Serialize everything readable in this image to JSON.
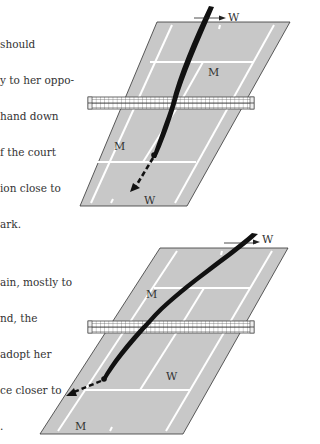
{
  "paragraphs": [
    {
      "id": "para1",
      "lines": [
        "should",
        "y to her oppo-",
        "hand down",
        "f the court",
        "ion close to",
        "ark."
      ]
    },
    {
      "id": "para2",
      "lines": [
        "ain, mostly to",
        "nd, the",
        "adopt her",
        "ce closer to",
        "."
      ]
    }
  ],
  "diagrams": [
    {
      "name": "top-court-diagram",
      "labels": {
        "server": "W",
        "far_player": "M",
        "near_player_left": "M",
        "near_player_bottom": "W"
      }
    },
    {
      "name": "bottom-court-diagram",
      "labels": {
        "server": "W",
        "far_player": "M",
        "near_player_mid": "W",
        "near_player_bottom": "M"
      }
    }
  ],
  "colors": {
    "court_fill": "#c8c8c8",
    "court_lines": "#ffffff",
    "outline": "#333333",
    "ball_path": "#111111",
    "net": "#555555"
  }
}
